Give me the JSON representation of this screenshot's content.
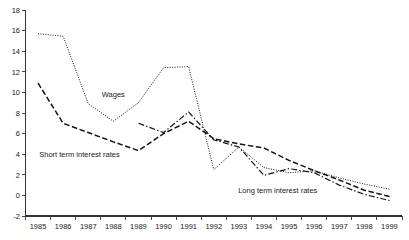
{
  "chart_data": {
    "type": "line",
    "title": "",
    "xlabel": "",
    "ylabel": "",
    "categories": [
      "1985",
      "1986",
      "1987",
      "1988",
      "1989",
      "1990",
      "1991",
      "1992",
      "1993",
      "1994",
      "1995",
      "1996",
      "1997",
      "1998",
      "1999"
    ],
    "x": [
      1985,
      1986,
      1987,
      1988,
      1989,
      1990,
      1991,
      1992,
      1993,
      1994,
      1995,
      1996,
      1997,
      1998,
      1999
    ],
    "ylim": [
      -2,
      18
    ],
    "yticks": [
      -2,
      0,
      2,
      4,
      6,
      8,
      10,
      12,
      14,
      16,
      18
    ],
    "ytick_labels": [
      "-2",
      "0",
      "2",
      "4",
      "6",
      "8",
      "10",
      "12",
      "14",
      "16",
      "18"
    ],
    "grid": false,
    "legend": "inline-annotations",
    "series": [
      {
        "name": "Wages",
        "style": "dotted",
        "label_text": "Wages",
        "values": [
          15.7,
          15.45,
          8.9,
          7.2,
          9.0,
          12.4,
          12.5,
          2.5,
          4.7,
          2.7,
          2.2,
          2.4,
          1.7,
          1.1,
          0.6
        ]
      },
      {
        "name": "Short term interest rates",
        "style": "dashed",
        "label_text": "Short term interest rates",
        "values": [
          10.9,
          7.0,
          6.1,
          5.2,
          4.35,
          6.0,
          7.2,
          5.5,
          5.0,
          4.6,
          3.4,
          2.4,
          1.5,
          0.5,
          -0.1
        ]
      },
      {
        "name": "Long term interest rates",
        "style": "dash-dot",
        "label_text": "Long term interest rates",
        "values": [
          null,
          null,
          null,
          null,
          7.0,
          6.1,
          8.1,
          5.4,
          4.7,
          1.95,
          2.6,
          2.2,
          1.0,
          0.1,
          -0.5
        ]
      }
    ],
    "annotations": [
      {
        "text": "Wages",
        "x_year": 1988.0,
        "y_value": 9.55
      },
      {
        "text": "Short term interest rates",
        "x_year": 1986.65,
        "y_value": 3.75
      },
      {
        "text": "Long term interest rates",
        "x_year": 1994.55,
        "y_value": 0.25
      }
    ],
    "colors": {
      "line": "#141414",
      "axis": "#333333",
      "text": "#1a1a1a",
      "background": "#ffffff"
    }
  }
}
